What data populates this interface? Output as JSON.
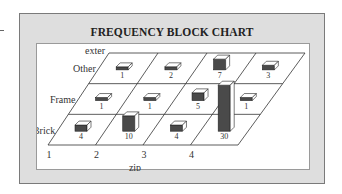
{
  "chart_data": {
    "type": "3d-block",
    "title": "FREQUENCY BLOCK CHART",
    "xlabel": "zip",
    "ylabel": "exter",
    "categories": [
      "1",
      "2",
      "3",
      "4"
    ],
    "rows": [
      "Other",
      "Frame",
      "Brick"
    ],
    "series": [
      {
        "name": "Other",
        "values": [
          1,
          2,
          7,
          3
        ]
      },
      {
        "name": "Frame",
        "values": [
          1,
          1,
          5,
          1
        ]
      },
      {
        "name": "Brick",
        "values": [
          4,
          10,
          4,
          30
        ]
      }
    ],
    "grid": true,
    "legend": "none",
    "colors": {
      "block_front": "#4a4a4a",
      "block_top": "#ffffff",
      "block_side": "#ffffff",
      "frame_bg": "#dedede",
      "panel_bg": "#ffffff"
    }
  }
}
